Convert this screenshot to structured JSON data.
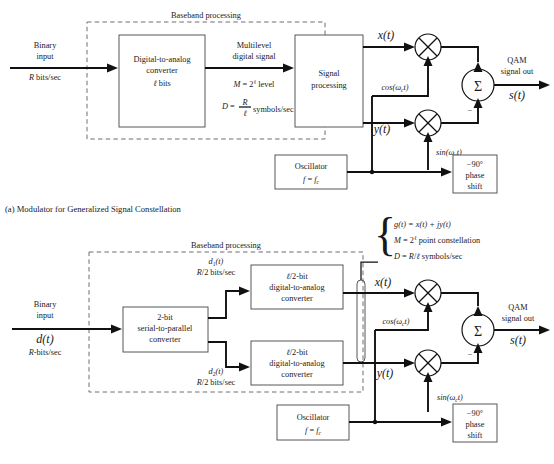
{
  "figure": {
    "title_a": "(a) Modulator for Generalized Signal Constellation",
    "baseband_label": "Baseband processing"
  },
  "diagram_a": {
    "input": {
      "line1": "Binary",
      "line2": "input",
      "rate": "R bits/sec",
      "rate_italic": "R",
      "rate_rest": " bits/sec"
    },
    "dac_box": {
      "line1": "Digital-to-analog",
      "line2": "converter",
      "line3_italic": "ℓ",
      "line3_rest": " bits"
    },
    "mid_label": {
      "line1": "Multilevel",
      "line2": "digital signal",
      "eq1_m": "M",
      "eq1_eq": " = 2",
      "eq1_exp": "ℓ",
      "eq1_tail": " level",
      "eq2_d": "D",
      "eq2_eq": " = ",
      "eq2_num": "R",
      "eq2_den": "ℓ",
      "eq2_tail": " symbols/sec"
    },
    "sp_box": {
      "line1": "Signal",
      "line2": "processing"
    },
    "x_label": "x(t)",
    "y_label": "y(t)",
    "cos_label": "cos(ω",
    "cos_sub": "c",
    "cos_tail": "t)",
    "sin_label": "sin(ω",
    "sin_sub": "c",
    "sin_tail": "t)",
    "osc_box": {
      "line1": "Oscillator",
      "line2_f": "f",
      "line2_eq": " = ",
      "line2_fc": "f",
      "line2_sub": "c"
    },
    "phase_box": {
      "line1": "−90°",
      "line2": "phase",
      "line3": "shift"
    },
    "sum_symbol": "Σ",
    "minus_symbol": "−",
    "output": {
      "line1": "QAM",
      "line2": "signal out",
      "line3": "s(t)"
    }
  },
  "diagram_b": {
    "input": {
      "line1": "Binary",
      "line2": "input",
      "sig": "d(t)",
      "rate_italic": "R",
      "rate_rest": "-bits/sec"
    },
    "sp_converter": {
      "line1": "2-bit",
      "line2": "serial-to-parallel",
      "line3": "converter"
    },
    "branch_top": {
      "sig": "d",
      "sig_sub": "1",
      "sig_tail": "(t)",
      "rate_num": "R",
      "rate_rest": "/2 bits/sec"
    },
    "branch_bottom": {
      "sig": "d",
      "sig_sub": "2",
      "sig_tail": "(t)",
      "rate_num": "R",
      "rate_rest": "/2 bits/sec"
    },
    "dac_top": {
      "line1_a": "ℓ",
      "line1_b": "/2-bit",
      "line2": "digital-to-analog",
      "line3": "converter"
    },
    "dac_bottom": {
      "line1_a": "ℓ",
      "line1_b": "/2-bit",
      "line2": "digital-to-analog",
      "line3": "converter"
    },
    "annotation": {
      "line1": "g(t)  =  x(t)  +  jy(t)",
      "line2_m": "M",
      "line2_eq": " = 2",
      "line2_exp": "ℓ",
      "line2_tail": " point constellation",
      "line3_d": "D",
      "line3_eq": " = ",
      "line3_r": "R",
      "line3_slash": "/",
      "line3_l": "ℓ",
      "line3_tail": "  symbols/sec"
    },
    "x_label": "x(t)",
    "y_label": "y(t)",
    "cos_label": "cos(ω",
    "cos_sub": "c",
    "cos_tail": "t)",
    "sin_label": "sin(ω",
    "sin_sub": "c",
    "sin_tail": "t)",
    "osc_box": {
      "line1": "Oscillator",
      "line2_f": "f",
      "line2_eq": " = ",
      "line2_fc": "f",
      "line2_sub": "c"
    },
    "phase_box": {
      "line1": "−90°",
      "line2": "phase",
      "line3": "shift"
    },
    "sum_symbol": "Σ",
    "minus_symbol": "−",
    "output": {
      "line1": "QAM",
      "line2": "signal out",
      "line3": "s(t)"
    }
  },
  "colors": {
    "line": "#111111",
    "box_stroke": "#55565a",
    "dashed_stroke": "#6e6f73",
    "text": "#1a1a1a",
    "background": "#ffffff"
  }
}
